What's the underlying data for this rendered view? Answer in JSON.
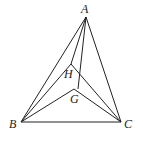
{
  "diagram": {
    "points": {
      "A": {
        "label": "A",
        "x": 86,
        "y": 17
      },
      "B": {
        "label": "B",
        "x": 21,
        "y": 122
      },
      "C": {
        "label": "C",
        "x": 121,
        "y": 122
      },
      "H": {
        "label": "H",
        "x": 71,
        "y": 64
      },
      "G": {
        "label": "G",
        "x": 74,
        "y": 89
      }
    },
    "segments": [
      "AB",
      "AC",
      "BC",
      "AH",
      "AG",
      "BH",
      "HC",
      "BG",
      "GC"
    ],
    "stroke_color": "#222222"
  }
}
